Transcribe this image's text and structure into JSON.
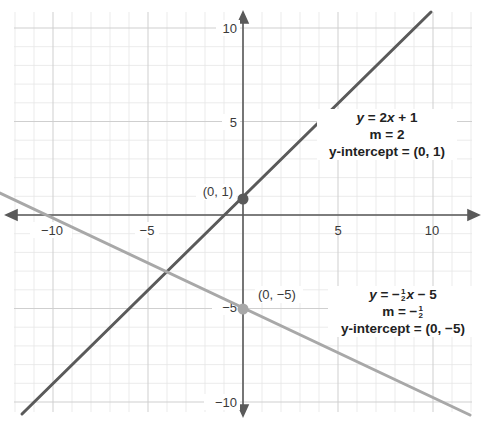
{
  "chart_data": {
    "type": "line",
    "title": "",
    "xlabel": "",
    "ylabel": "",
    "xlim": [
      -12,
      12
    ],
    "ylim": [
      -10.5,
      10.5
    ],
    "grid": true,
    "x_ticks": [
      -10,
      -5,
      5,
      10
    ],
    "y_ticks": [
      10,
      5,
      -5,
      -10
    ],
    "x_tick_labels": [
      "−10",
      "−5",
      "5",
      "10"
    ],
    "y_tick_labels": [
      "10",
      "5",
      "−5",
      "−10"
    ],
    "series": [
      {
        "name": "y = 2x + 1",
        "equation": "y = 2x + 1",
        "slope": 2,
        "intercept": 1,
        "slope_label": "m = 2",
        "intercept_label": "y-intercept = (0, 1)",
        "color": "#5a5a5a",
        "x": [
          -5.5,
          4.75
        ],
        "y": [
          -10,
          10.5
        ]
      },
      {
        "name": "y = -1/2 x - 5",
        "equation": "y = −½x − 5",
        "slope": -0.5,
        "intercept": -5,
        "slope_label": "m = −½",
        "intercept_label": "y-intercept = (0, −5)",
        "color": "#a8a8a8",
        "x": [
          -12.5,
          12
        ],
        "y": [
          1.25,
          -11
        ]
      }
    ],
    "points": [
      {
        "x": 0,
        "y": 1,
        "label": "(0, 1)",
        "color": "#5a5a5a"
      },
      {
        "x": 0,
        "y": -5,
        "label": "(0, −5)",
        "color": "#a8a8a8"
      }
    ],
    "annotations": [
      {
        "text": "y = 2x + 1",
        "near": [
          6,
          5
        ]
      },
      {
        "text": "m = 2",
        "near": [
          6,
          4
        ]
      },
      {
        "text": "y-intercept = (0, 1)",
        "near": [
          6,
          3
        ]
      },
      {
        "text": "y = −½x − 5",
        "near": [
          7.5,
          -4.5
        ]
      },
      {
        "text": "m = −½",
        "near": [
          7.5,
          -5.5
        ]
      },
      {
        "text": "y-intercept = (0, −5)",
        "near": [
          7.5,
          -6.5
        ]
      }
    ]
  },
  "labels": {
    "eq1_line1_y": "y",
    "eq1_line1_rest": " = 2",
    "eq1_line1_x": "x",
    "eq1_line1_tail": " + 1",
    "eq1_line2": "m = 2",
    "eq1_line3": "y-intercept = (0, 1)",
    "eq2_line1_y": "y",
    "eq2_line1_rest": " = −",
    "eq2_frac_num": "1",
    "eq2_frac_den": "2",
    "eq2_line1_x": "x",
    "eq2_line1_tail": " − 5",
    "eq2_line2_pre": "m = −",
    "eq2_line3": "y-intercept = (0, −5)",
    "pt1": "(0, 1)",
    "pt2": "(0, −5)",
    "xt_m10": "−10",
    "xt_m5": "−5",
    "xt_5": "5",
    "xt_10": "10",
    "yt_10": "10",
    "yt_5": "5",
    "yt_m5": "−5",
    "yt_m10": "−10"
  }
}
